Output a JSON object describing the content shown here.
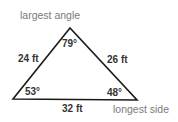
{
  "diagram": {
    "type": "triangle",
    "annotations": {
      "top": "largest angle",
      "bottom_right": "longest side"
    },
    "angles": {
      "top": "79°",
      "bottom_left": "53°",
      "bottom_right": "48°"
    },
    "sides": {
      "left": "24 ft",
      "right": "26 ft",
      "bottom": "32 ft"
    },
    "colors": {
      "line": "#1a1a1a",
      "label": "#333333",
      "annotation": "#7a7a7a"
    }
  }
}
